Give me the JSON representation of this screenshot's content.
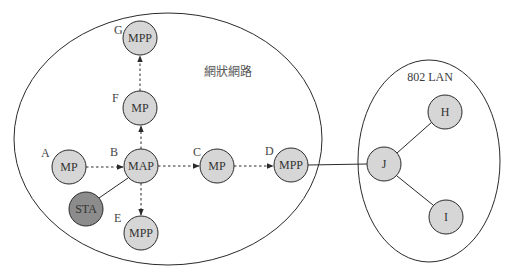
{
  "colors": {
    "node_fill": "#d6d6d6",
    "sta_fill": "#8c8c8c",
    "stroke": "#2a2a2a",
    "background": "#ffffff"
  },
  "regions": {
    "mesh": {
      "title": "網狀網路"
    },
    "lan": {
      "title": "802 LAN"
    }
  },
  "nodes": {
    "G": {
      "letter": "G",
      "type": "MPP"
    },
    "F": {
      "letter": "F",
      "type": "MP"
    },
    "A": {
      "letter": "A",
      "type": "MP"
    },
    "B": {
      "letter": "B",
      "type": "MAP"
    },
    "C": {
      "letter": "C",
      "type": "MP"
    },
    "D": {
      "letter": "D",
      "type": "MPP"
    },
    "E": {
      "letter": "E",
      "type": "MPP"
    },
    "STA": {
      "type": "STA"
    },
    "J": {
      "type": "J"
    },
    "H": {
      "type": "H"
    },
    "I": {
      "type": "I"
    }
  },
  "edges": [
    {
      "from": "A",
      "to": "B",
      "style": "dashed-arrow"
    },
    {
      "from": "B",
      "to": "F",
      "style": "dashed-arrow"
    },
    {
      "from": "F",
      "to": "G",
      "style": "dashed-arrow"
    },
    {
      "from": "B",
      "to": "C",
      "style": "dashed-arrow"
    },
    {
      "from": "C",
      "to": "D",
      "style": "dashed-arrow"
    },
    {
      "from": "B",
      "to": "E",
      "style": "dashed-arrow"
    },
    {
      "from": "B",
      "to": "STA",
      "style": "solid"
    },
    {
      "from": "D",
      "to": "J",
      "style": "solid"
    },
    {
      "from": "J",
      "to": "H",
      "style": "solid"
    },
    {
      "from": "J",
      "to": "I",
      "style": "solid"
    }
  ]
}
